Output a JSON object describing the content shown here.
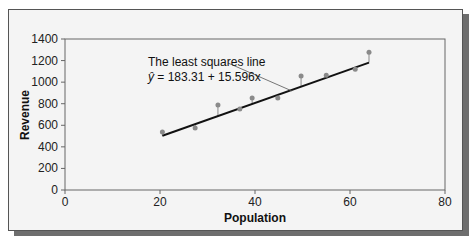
{
  "chart_data": {
    "type": "scatter",
    "title": "",
    "xlabel": "Population",
    "ylabel": "Revenue",
    "xlim": [
      0,
      80
    ],
    "ylim": [
      0,
      1400
    ],
    "x_ticks": [
      "0",
      "20",
      "40",
      "60",
      "80"
    ],
    "y_ticks": [
      "0",
      "200",
      "400",
      "600",
      "800",
      "1000",
      "1200",
      "1400"
    ],
    "grid": false,
    "legend": null,
    "series": [
      {
        "name": "Observations",
        "x": [
          20.5,
          27.4,
          32.2,
          36.8,
          39.4,
          44.8,
          49.7,
          55.0,
          61.1,
          64.0
        ],
        "y": [
          537,
          574,
          787,
          750,
          852,
          852,
          1056,
          1065,
          1120,
          1278
        ]
      }
    ],
    "regression_line": {
      "intercept": 183.31,
      "slope": 15.596,
      "x_range": [
        20.5,
        64.0
      ]
    },
    "annotations": [
      "The least squares line",
      "ŷ = 183.31 + 15.596x"
    ]
  },
  "labels": {
    "annot_line1": "The least squares line",
    "annot_line2_prefix": "ŷ",
    "annot_line2_rest": " = 183.31 + 15.596x",
    "xlabel": "Population",
    "ylabel": "Revenue",
    "xticks": [
      "0",
      "20",
      "40",
      "60",
      "80"
    ],
    "yticks": [
      "0",
      "200",
      "400",
      "600",
      "800",
      "1000",
      "1200",
      "1400"
    ]
  }
}
